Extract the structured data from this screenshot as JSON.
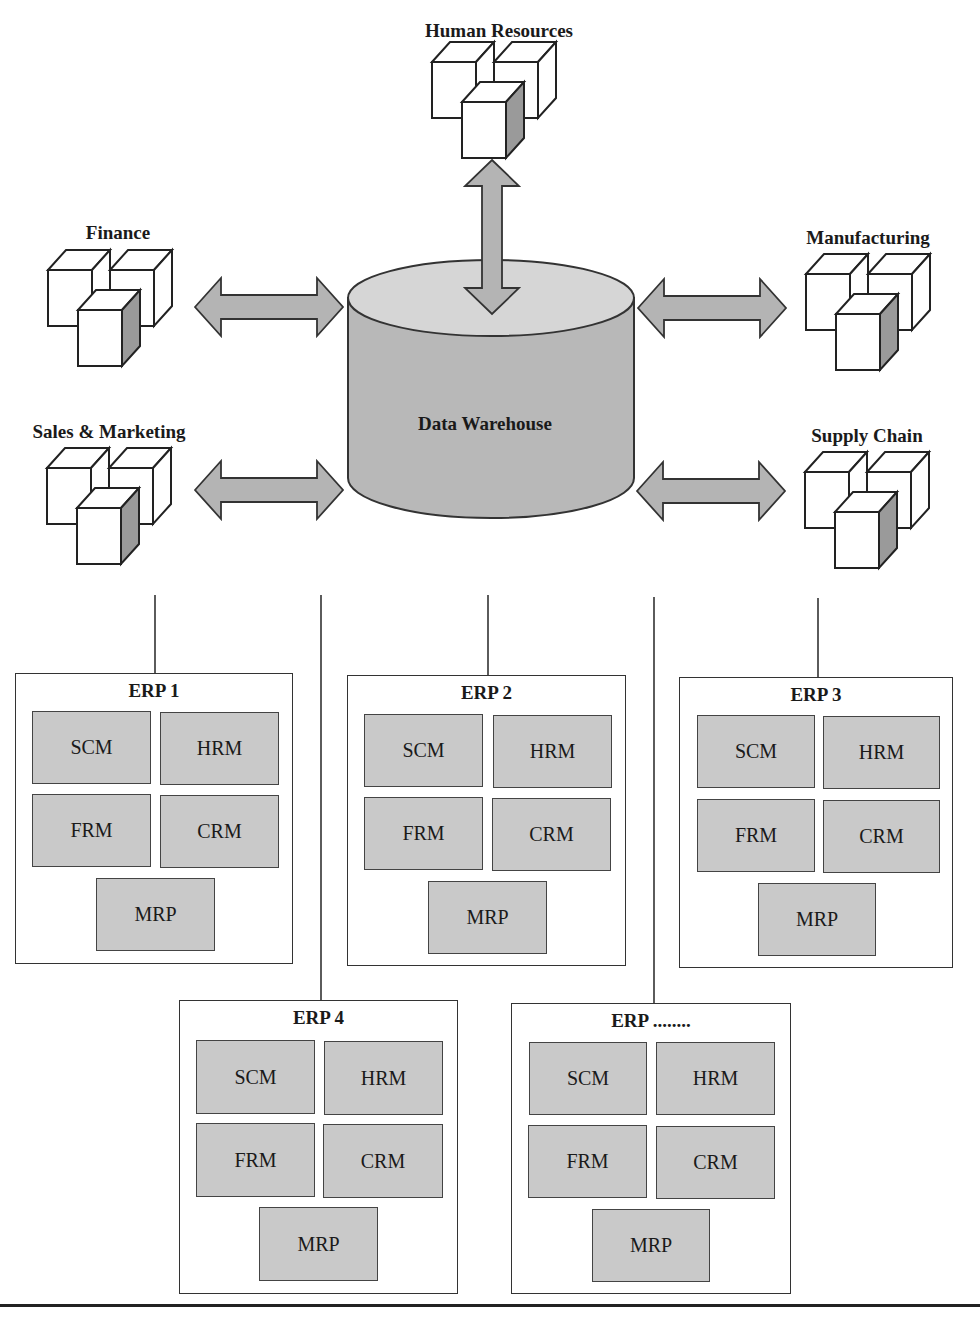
{
  "diagram": {
    "type": "architecture",
    "center": {
      "label": "Data Warehouse",
      "shape": "cylinder-icon"
    },
    "departments": [
      {
        "id": "human-resources",
        "label": "Human Resources",
        "icon": "cubes-icon",
        "connection": "bidirectional-arrow"
      },
      {
        "id": "finance",
        "label": "Finance",
        "icon": "cubes-icon",
        "connection": "bidirectional-arrow"
      },
      {
        "id": "manufacturing",
        "label": "Manufacturing",
        "icon": "cubes-icon",
        "connection": "bidirectional-arrow"
      },
      {
        "id": "sales-marketing",
        "label": "Sales & Marketing",
        "icon": "cubes-icon",
        "connection": "bidirectional-arrow"
      },
      {
        "id": "supply-chain",
        "label": "Supply Chain",
        "icon": "cubes-icon",
        "connection": "bidirectional-arrow"
      }
    ],
    "erp_systems": [
      {
        "title": "ERP 1",
        "modules": [
          "SCM",
          "HRM",
          "FRM",
          "CRM",
          "MRP"
        ]
      },
      {
        "title": "ERP 2",
        "modules": [
          "SCM",
          "HRM",
          "FRM",
          "CRM",
          "MRP"
        ]
      },
      {
        "title": "ERP 3",
        "modules": [
          "SCM",
          "HRM",
          "FRM",
          "CRM",
          "MRP"
        ]
      },
      {
        "title": "ERP 4",
        "modules": [
          "SCM",
          "HRM",
          "FRM",
          "CRM",
          "MRP"
        ]
      },
      {
        "title": "ERP ........",
        "modules": [
          "SCM",
          "HRM",
          "FRM",
          "CRM",
          "MRP"
        ]
      }
    ]
  },
  "colors": {
    "module_fill": "#c9c9c9",
    "arrow_fill": "#b4b4b4",
    "cylinder_body": "#b8b8b8",
    "cylinder_top": "#d6d6d6",
    "stroke": "#333333"
  }
}
